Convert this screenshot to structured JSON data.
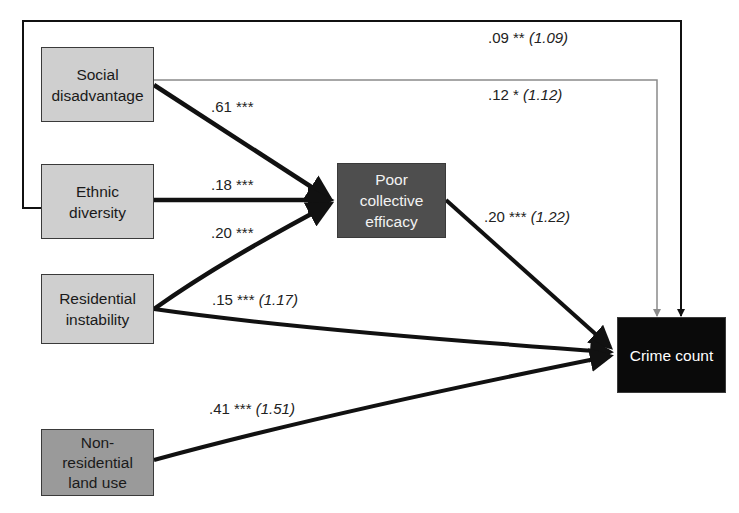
{
  "diagram": {
    "type": "path-model",
    "nodes": [
      {
        "id": "social",
        "label": "Social\ndisadvantage",
        "shade": "light"
      },
      {
        "id": "ethnic",
        "label": "Ethnic\ndiversity",
        "shade": "light"
      },
      {
        "id": "residential",
        "label": "Residential\ninstability",
        "shade": "light"
      },
      {
        "id": "nonres",
        "label": "Non-\nresidential\nland use",
        "shade": "mid"
      },
      {
        "id": "efficacy",
        "label": "Poor\ncollective\nefficacy",
        "shade": "dark"
      },
      {
        "id": "crime",
        "label": "Crime count",
        "shade": "black"
      }
    ],
    "edges": [
      {
        "from": "social",
        "to": "efficacy",
        "coef": ".61",
        "sig": "***",
        "irr": ""
      },
      {
        "from": "ethnic",
        "to": "efficacy",
        "coef": ".18",
        "sig": "***",
        "irr": ""
      },
      {
        "from": "residential",
        "to": "efficacy",
        "coef": ".20",
        "sig": "***",
        "irr": ""
      },
      {
        "from": "efficacy",
        "to": "crime",
        "coef": ".20",
        "sig": "***",
        "irr": "(1.22)"
      },
      {
        "from": "residential",
        "to": "crime",
        "coef": ".15",
        "sig": "***",
        "irr": "(1.17)"
      },
      {
        "from": "nonres",
        "to": "crime",
        "coef": ".41",
        "sig": "***",
        "irr": "(1.51)"
      },
      {
        "from": "social",
        "to": "crime",
        "coef": ".12",
        "sig": "*",
        "irr": "(1.12)"
      },
      {
        "from": "ethnic",
        "to": "crime",
        "coef": ".09",
        "sig": "**",
        "irr": "(1.09)"
      }
    ]
  },
  "colors": {
    "light_box": "#cfcfcf",
    "mid_box": "#9a9a9a",
    "dark_box": "#4e4e4e",
    "outcome_box": "#0a0a0a",
    "thick_edge": "#111111",
    "thin_gray_edge": "#8a8a8a"
  }
}
